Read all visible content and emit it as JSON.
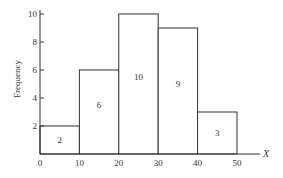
{
  "chart_data": {
    "type": "bar",
    "subtype": "histogram",
    "title": "",
    "xlabel": "X",
    "ylabel": "Frequency",
    "bins": [
      {
        "start": 0,
        "end": 10,
        "value": 2,
        "label": "2"
      },
      {
        "start": 10,
        "end": 20,
        "value": 6,
        "label": "6"
      },
      {
        "start": 20,
        "end": 30,
        "value": 10,
        "label": "10"
      },
      {
        "start": 30,
        "end": 40,
        "value": 9,
        "label": "9"
      },
      {
        "start": 40,
        "end": 50,
        "value": 3,
        "label": "3"
      }
    ],
    "categories": [
      "0-10",
      "10-20",
      "20-30",
      "30-40",
      "40-50"
    ],
    "values": [
      2,
      6,
      10,
      9,
      3
    ],
    "x_ticks": [
      0,
      10,
      20,
      30,
      40,
      50
    ],
    "y_ticks": [
      2,
      4,
      6,
      8,
      10
    ],
    "xlim": [
      0,
      55
    ],
    "ylim": [
      0,
      10
    ],
    "grid": false,
    "legend": null,
    "colors": {
      "line": "#333333",
      "fill": "#ffffff"
    }
  }
}
